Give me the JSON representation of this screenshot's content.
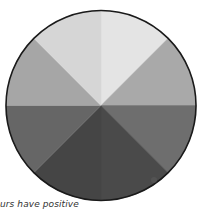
{
  "diagram": {
    "type": "grayscale-value-wheel",
    "segment_count": 8,
    "center": {
      "x": 101,
      "y": 105.5
    },
    "radius": 95,
    "outline_color": "#1a1a1a",
    "segments": [
      {
        "name": "segment-n-ne",
        "from_deg": -90,
        "to_deg": -45,
        "fill": "#e4e4e4"
      },
      {
        "name": "segment-ne-e",
        "from_deg": -45,
        "to_deg": 0,
        "fill": "#a9a9a9"
      },
      {
        "name": "segment-e-se",
        "from_deg": 0,
        "to_deg": 45,
        "fill": "#6e6e6e"
      },
      {
        "name": "segment-se-s",
        "from_deg": 45,
        "to_deg": 90,
        "fill": "#4a4a4a"
      },
      {
        "name": "segment-s-sw",
        "from_deg": 90,
        "to_deg": 135,
        "fill": "#454545"
      },
      {
        "name": "segment-sw-w",
        "from_deg": 135,
        "to_deg": 180,
        "fill": "#666666"
      },
      {
        "name": "segment-w-nw",
        "from_deg": 180,
        "to_deg": 225,
        "fill": "#a6a6a6"
      },
      {
        "name": "segment-nw-n",
        "from_deg": 225,
        "to_deg": 270,
        "fill": "#d6d6d6"
      }
    ]
  },
  "caption": {
    "text": "urs have positive"
  }
}
